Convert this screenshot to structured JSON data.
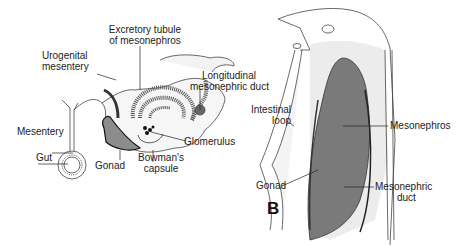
{
  "figure": {
    "panel_b_letter": "B",
    "panel_a_labels": {
      "excretory_tubule_line1": "Excretory tubule",
      "excretory_tubule_line2": "of mesonephros",
      "urogenital_mesentery_line1": "Urogenital",
      "urogenital_mesentery_line2": "mesentery",
      "longitudinal_duct_line1": "Longitudinal",
      "longitudinal_duct_line2": "mesonephric duct",
      "mesentery": "Mesentery",
      "glomerulus": "Glomerulus",
      "gut": "Gut",
      "gonad": "Gonad",
      "bowmans_capsule_line1": "Bowman's",
      "bowmans_capsule_line2": "capsule"
    },
    "panel_b_labels": {
      "intestinal_loop_line1": "Intestinal",
      "intestinal_loop_line2": "loop",
      "mesonephros": "Mesonephros",
      "gonad": "Gonad",
      "mesonephric_duct_line1": "Mesonephric",
      "mesonephric_duct_line2": "duct"
    },
    "colors": {
      "organ_fill": "#7a7a7a",
      "gonad_fill": "#8c8c8c",
      "tissue_stipple": "#e8e8e8",
      "line": "#333333"
    }
  }
}
